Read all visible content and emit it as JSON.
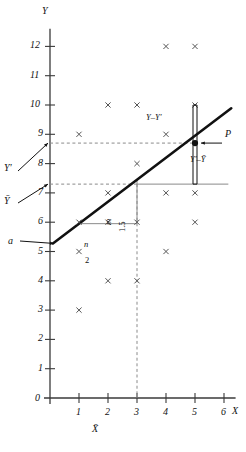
{
  "figure": {
    "type": "scatter-with-regression-line",
    "axis_labels": {
      "x": "X",
      "y": "Y"
    },
    "origin_label": "0"
  },
  "chart_data": {
    "type": "scatter",
    "title": "",
    "xlabel": "X",
    "ylabel": "Y",
    "xlim": [
      0,
      6.4
    ],
    "ylim": [
      0,
      12.6
    ],
    "xticks": [
      0,
      1,
      2,
      3,
      4,
      5,
      6
    ],
    "xtick_labels": [
      "0",
      "1",
      "2",
      "3",
      "4",
      "5",
      "6"
    ],
    "yticks": [
      0,
      1,
      2,
      3,
      4,
      5,
      6,
      7,
      8,
      9,
      10,
      11,
      12
    ],
    "ytick_labels": [
      "0",
      "1",
      "2",
      "3",
      "4",
      "5",
      "6",
      "7",
      "8",
      "9",
      "10",
      "11",
      "12"
    ],
    "grid": false,
    "legend": null,
    "marker": "x",
    "points": [
      {
        "x": 4,
        "y": 12
      },
      {
        "x": 5,
        "y": 12
      },
      {
        "x": 2,
        "y": 10
      },
      {
        "x": 3,
        "y": 10
      },
      {
        "x": 5,
        "y": 10
      },
      {
        "x": 1,
        "y": 9
      },
      {
        "x": 4,
        "y": 9
      },
      {
        "x": 3,
        "y": 8
      },
      {
        "x": 2,
        "y": 7
      },
      {
        "x": 4,
        "y": 7
      },
      {
        "x": 5,
        "y": 7
      },
      {
        "x": 1,
        "y": 6
      },
      {
        "x": 2,
        "y": 6
      },
      {
        "x": 3,
        "y": 6
      },
      {
        "x": 5,
        "y": 6
      },
      {
        "x": 1,
        "y": 5
      },
      {
        "x": 4,
        "y": 5
      },
      {
        "x": 2,
        "y": 4
      },
      {
        "x": 3,
        "y": 4
      },
      {
        "x": 1,
        "y": 3
      }
    ],
    "regression_line": {
      "intercept": 5.2,
      "slope": 0.75,
      "x_start": 0.1,
      "x_end": 6.25,
      "equation_note": "slope = 1.5 / 2"
    },
    "reference_lines": [
      {
        "name": "y-bar",
        "orientation": "horizontal",
        "value": 7.3,
        "style": "dashed-then-solid"
      },
      {
        "name": "y-prime",
        "orientation": "horizontal",
        "value": 8.7,
        "style": "dashed"
      },
      {
        "name": "x-bar",
        "orientation": "vertical",
        "value": 3,
        "style": "dashed"
      }
    ],
    "highlight_point": {
      "name": "P",
      "x": 5,
      "y": 8.7
    },
    "observed_point": {
      "x": 5,
      "y": 10
    }
  },
  "annotations": {
    "intercept": "a",
    "residual": "Y–Y′",
    "explained": "Y′–Ȳ",
    "point": "P",
    "y_predicted": "Y′",
    "y_mean": "Ȳ",
    "x_mean": "X̄",
    "slope_run_symbol": "n",
    "slope_run_value": "2",
    "slope_rise_symbol": "m",
    "slope_rise_value": "1.5"
  },
  "colors": {
    "axis": "#3a3a3a",
    "line": "#111111",
    "marker": "#555555",
    "guide": "#8a8a8a",
    "text": "#111111"
  }
}
